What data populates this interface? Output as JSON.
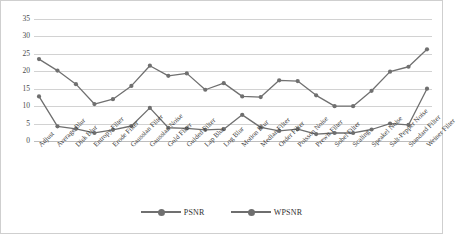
{
  "chart_data": {
    "type": "line",
    "title": "",
    "xlabel": "",
    "ylabel": "",
    "ylim": [
      0,
      35
    ],
    "yticks": [
      0,
      5,
      10,
      15,
      20,
      25,
      30,
      35
    ],
    "grid": true,
    "legend_position": "bottom",
    "categories": [
      "Adjust",
      "Average Blur",
      "Disk Blur",
      "Entropy Filter",
      "Erode Filter",
      "Gaussian Filter",
      "Gaussian Noise",
      "Gold Filter",
      "Guided Filter",
      "Lap Blur",
      "Log Blur",
      "Motion Blur",
      "Median Filter",
      "Order Filter",
      "Poisson Noise",
      "Prewit Filter",
      "Sobel Filter",
      "Scaling",
      "Speakel Noise",
      "Salt-Pepper Noise",
      "Standard Filter",
      "Weiner Filter"
    ],
    "series": [
      {
        "name": "PSNR",
        "color": "#707070",
        "values": [
          23.5,
          20.2,
          16.3,
          10.6,
          12.0,
          15.8,
          21.6,
          18.7,
          19.4,
          14.7,
          16.6,
          12.8,
          12.6,
          17.4,
          17.2,
          13.1,
          10.0,
          10.0,
          14.4,
          19.9,
          21.3,
          26.3
        ]
      },
      {
        "name": "WPSNR",
        "color": "#6e6e6e",
        "values": [
          12.8,
          4.2,
          3.5,
          2.3,
          3.2,
          4.3,
          9.5,
          3.8,
          3.6,
          3.2,
          3.4,
          7.5,
          3.9,
          2.9,
          3.4,
          2.0,
          2.3,
          2.3,
          3.3,
          5.0,
          4.6,
          15.0
        ]
      }
    ]
  },
  "legend": {
    "items": [
      {
        "label": "PSNR"
      },
      {
        "label": "WPSNR"
      }
    ]
  }
}
